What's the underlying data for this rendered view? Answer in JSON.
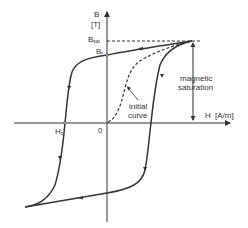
{
  "diagram": {
    "type": "hysteresis-loop",
    "axes": {
      "y_label": "B",
      "y_unit": "[T]",
      "x_label": "H",
      "x_unit": "[A/m]",
      "origin_label": "0"
    },
    "points": {
      "b_sat": {
        "main": "B",
        "sub": "sat"
      },
      "b_r": {
        "main": "B",
        "sub": "r"
      },
      "h_c": {
        "main": "H",
        "sub": "c"
      }
    },
    "annotations": {
      "saturation_line1": "magnetic",
      "saturation_line2": "saturation",
      "initial_line1": "initial",
      "initial_line2": "curve"
    },
    "colors": {
      "line": "#333333",
      "background": "#ffffff"
    }
  }
}
